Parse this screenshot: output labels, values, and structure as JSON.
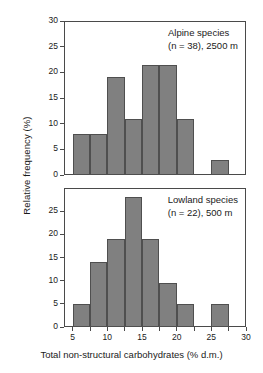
{
  "axes": {
    "ylabel": "Relative frequency (%)",
    "xlabel": "Total non-structural carbohydrates (% d.m.)",
    "xticks": [
      "5",
      "10",
      "15",
      "20",
      "25",
      "30"
    ],
    "top_yticks": [
      "0",
      "5",
      "10",
      "15",
      "20",
      "25",
      "30"
    ],
    "bottom_yticks": [
      "0",
      "5",
      "10",
      "15",
      "20",
      "25"
    ]
  },
  "panels": {
    "top": {
      "annotation_line1": "Alpine species",
      "annotation_line2": "(n = 38), 2500 m"
    },
    "bottom": {
      "annotation_line1": "Lowland species",
      "annotation_line2": "(n = 22), 500 m"
    }
  },
  "style": {
    "bar_fill": "#808080",
    "bar_edge": "#4f4f4f",
    "axis_color": "#4a4a4a"
  },
  "chart_data": {
    "type": "bar",
    "title": "",
    "xlabel": "Total non-structural carbohydrates (% d.m.)",
    "ylabel": "Relative frequency (%)",
    "xlim": [
      3.75,
      30
    ],
    "bin_width": 2.5,
    "grid": false,
    "legend": "none",
    "panels": [
      {
        "name": "Alpine species",
        "note": "(n = 38), 2500 m",
        "n": 38,
        "elevation_m": 2500,
        "ylim": [
          0,
          30
        ],
        "yticks": [
          0,
          5,
          10,
          15,
          20,
          25,
          30
        ],
        "bin_starts": [
          5,
          7.5,
          10,
          12.5,
          15,
          17.5,
          20,
          25
        ],
        "values": [
          8.0,
          8.0,
          19.0,
          11.0,
          21.5,
          21.5,
          11.0,
          3.0
        ]
      },
      {
        "name": "Lowland species",
        "note": "(n = 22), 500 m",
        "n": 22,
        "elevation_m": 500,
        "ylim": [
          0,
          30
        ],
        "yticks": [
          0,
          5,
          10,
          15,
          20,
          25
        ],
        "bin_starts": [
          5,
          7.5,
          10,
          12.5,
          15,
          17.5,
          20,
          25
        ],
        "values": [
          5.0,
          14.0,
          19.0,
          28.0,
          19.0,
          9.5,
          5.0,
          5.0
        ]
      }
    ]
  }
}
